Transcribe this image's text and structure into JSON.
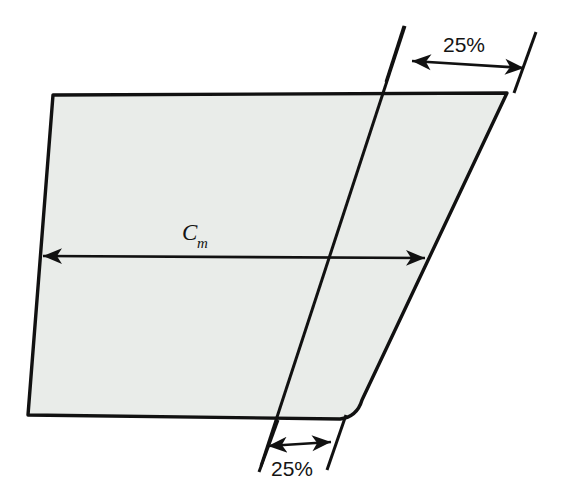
{
  "diagram": {
    "type": "engineering-planform-diagram",
    "colors": {
      "fill": "#e9ece9",
      "outline": "#111111",
      "background": "#ffffff",
      "text": "#141414"
    },
    "planform": {
      "name": "wing-planform",
      "fill": "#e9ece9",
      "stroke": "#111111",
      "stroke_width": 3.4,
      "points": [
        [
          53,
          95
        ],
        [
          507,
          93
        ],
        [
          360,
          404
        ],
        [
          347,
          417
        ],
        [
          330,
          420
        ],
        [
          28,
          415
        ]
      ]
    },
    "quarter_chord_line": {
      "name": "quarter-chord-line",
      "x1": 405,
      "y1": 26,
      "x2": 261,
      "y2": 466,
      "stroke_width": 3.0
    },
    "chord_dimension": {
      "label_main": "C",
      "label_subscript": "m",
      "label_x": 182,
      "label_y": 240,
      "sub_x": 197,
      "sub_y": 248,
      "x1": 43,
      "y1": 256,
      "x2": 425,
      "y2": 258,
      "stroke_width": 2.6
    },
    "top_dimension": {
      "label": "25%",
      "label_x": 443,
      "label_y": 52,
      "arrow_x1": 412,
      "arrow_y1": 61,
      "arrow_x2": 524,
      "arrow_y2": 68,
      "stroke_width": 2.6,
      "extension_left": {
        "x1": 404,
        "y1": 26,
        "x2": 386,
        "y2": 82
      },
      "extension_right": {
        "x1": 536,
        "y1": 32,
        "x2": 514,
        "y2": 93
      }
    },
    "bottom_dimension": {
      "label": "25%",
      "label_x": 271,
      "label_y": 476,
      "arrow_x1": 268,
      "arrow_y1": 446,
      "arrow_x2": 331,
      "arrow_y2": 442,
      "stroke_width": 2.6,
      "extension_left": {
        "x1": 278,
        "y1": 420,
        "x2": 259,
        "y2": 472
      },
      "extension_right": {
        "x1": 346,
        "y1": 415,
        "x2": 327,
        "y2": 470
      }
    }
  }
}
